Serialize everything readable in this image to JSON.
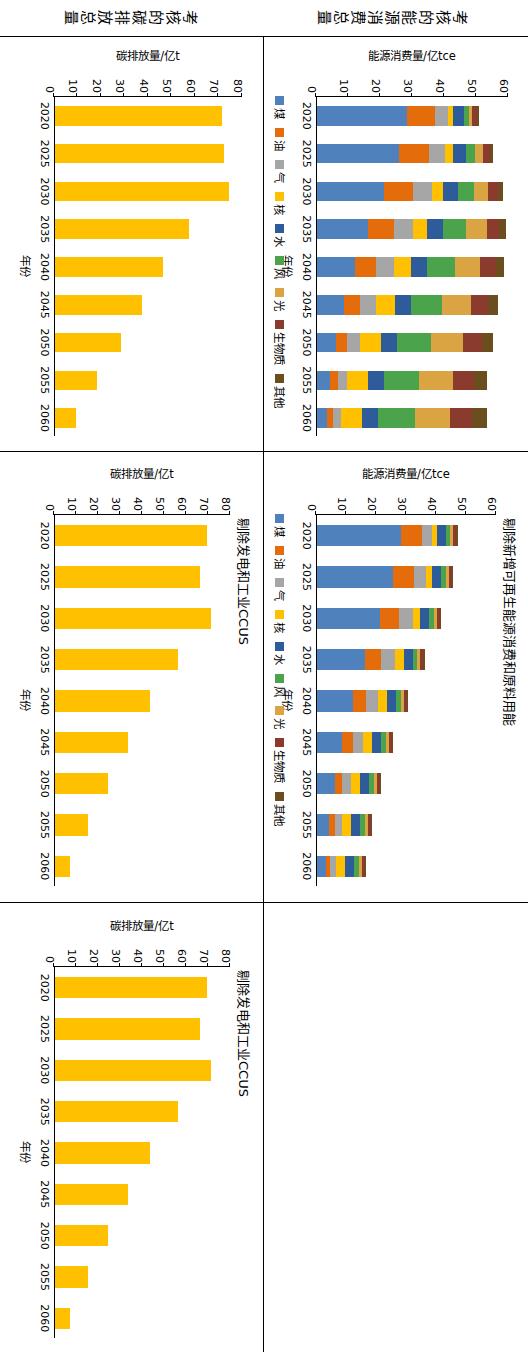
{
  "figure": {
    "row_labels": [
      {
        "id": "row-energy",
        "text": "考核的能源消费总量"
      },
      {
        "id": "row-carbon",
        "text": "考核的碳排放总量"
      }
    ]
  },
  "legend": {
    "labels": [
      "煤",
      "油",
      "气",
      "核",
      "水",
      "风",
      "光",
      "生物质",
      "其他"
    ],
    "colors": [
      "#4F81BD",
      "#E46C0A",
      "#A6A6A6",
      "#FFC000",
      "#2E5C9A",
      "#4BA44B",
      "#D9A441",
      "#8B3A2E",
      "#6A4E1E"
    ]
  },
  "chart_data": [
    {
      "id": "chart-energy-total",
      "type": "bar",
      "stacked": true,
      "title": "",
      "xlabel": "年份",
      "ylabel": "能源消费量/亿tce",
      "categories": [
        "2020",
        "2025",
        "2030",
        "2035",
        "2040",
        "2045",
        "2050",
        "2055",
        "2060"
      ],
      "ylim": [
        0,
        60
      ],
      "yticks": [
        0,
        10,
        20,
        30,
        40,
        50,
        60
      ],
      "series": [
        {
          "name": "煤",
          "color": "#4F81BD",
          "values": [
            28.0,
            25.5,
            21.0,
            16.0,
            12.0,
            8.5,
            6.0,
            4.0,
            3.0
          ]
        },
        {
          "name": "油",
          "color": "#E46C0A",
          "values": [
            9.0,
            9.5,
            9.0,
            8.0,
            6.5,
            5.0,
            3.5,
            2.5,
            2.0
          ]
        },
        {
          "name": "气",
          "color": "#A6A6A6",
          "values": [
            4.0,
            5.0,
            6.0,
            6.0,
            5.5,
            5.0,
            4.0,
            3.0,
            2.5
          ]
        },
        {
          "name": "核",
          "color": "#FFC000",
          "values": [
            1.5,
            2.5,
            3.5,
            4.5,
            5.5,
            6.0,
            6.5,
            6.5,
            6.5
          ]
        },
        {
          "name": "水",
          "color": "#2E5C9A",
          "values": [
            3.5,
            4.0,
            4.5,
            5.0,
            5.0,
            5.0,
            5.0,
            5.0,
            5.0
          ]
        },
        {
          "name": "风",
          "color": "#4BA44B",
          "values": [
            1.5,
            3.0,
            5.0,
            7.0,
            8.5,
            9.5,
            10.5,
            11.0,
            11.5
          ]
        },
        {
          "name": "光",
          "color": "#D9A441",
          "values": [
            1.0,
            2.5,
            4.5,
            6.5,
            8.0,
            9.0,
            10.0,
            10.5,
            11.0
          ]
        },
        {
          "name": "生物质",
          "color": "#8B3A2E",
          "values": [
            1.5,
            2.0,
            3.0,
            4.0,
            5.0,
            5.5,
            6.0,
            6.5,
            7.0
          ]
        },
        {
          "name": "其他",
          "color": "#6A4E1E",
          "values": [
            0.5,
            1.0,
            1.5,
            2.0,
            2.5,
            3.0,
            3.5,
            4.0,
            4.5
          ]
        }
      ]
    },
    {
      "id": "chart-energy-excl-renewable",
      "type": "bar",
      "stacked": true,
      "title": "剔除新增可再生能源消费和原料用能",
      "xlabel": "年份",
      "ylabel": "能源消费量/亿tce",
      "categories": [
        "2020",
        "2025",
        "2030",
        "2035",
        "2040",
        "2045",
        "2050",
        "2055",
        "2060"
      ],
      "ylim": [
        0,
        60
      ],
      "yticks": [
        0,
        10,
        20,
        30,
        40,
        50,
        60
      ],
      "series": [
        {
          "name": "煤",
          "color": "#4F81BD",
          "values": [
            28.0,
            25.5,
            21.0,
            16.0,
            12.0,
            8.5,
            6.0,
            4.0,
            3.0
          ]
        },
        {
          "name": "油",
          "color": "#E46C0A",
          "values": [
            7.0,
            7.0,
            6.5,
            5.5,
            4.5,
            3.5,
            2.5,
            2.0,
            1.5
          ]
        },
        {
          "name": "气",
          "color": "#A6A6A6",
          "values": [
            3.5,
            4.0,
            4.5,
            4.5,
            4.0,
            3.5,
            3.0,
            2.5,
            2.0
          ]
        },
        {
          "name": "核",
          "color": "#FFC000",
          "values": [
            1.5,
            2.0,
            2.5,
            3.0,
            3.0,
            3.0,
            3.0,
            3.0,
            3.0
          ]
        },
        {
          "name": "水",
          "color": "#2E5C9A",
          "values": [
            3.0,
            3.0,
            3.0,
            3.0,
            3.0,
            3.0,
            3.0,
            3.0,
            3.0
          ]
        },
        {
          "name": "风",
          "color": "#4BA44B",
          "values": [
            1.5,
            1.5,
            1.5,
            1.5,
            1.5,
            1.5,
            1.5,
            1.5,
            1.5
          ]
        },
        {
          "name": "光",
          "color": "#D9A441",
          "values": [
            1.0,
            1.0,
            1.0,
            1.0,
            1.0,
            1.0,
            1.0,
            1.0,
            1.0
          ]
        },
        {
          "name": "生物质",
          "color": "#8B3A2E",
          "values": [
            1.0,
            1.0,
            1.0,
            1.0,
            1.0,
            1.0,
            1.0,
            1.0,
            1.0
          ]
        },
        {
          "name": "其他",
          "color": "#6A4E1E",
          "values": [
            0.5,
            0.5,
            0.5,
            0.5,
            0.5,
            0.5,
            0.5,
            0.5,
            0.5
          ]
        }
      ]
    },
    {
      "id": "chart-carbon-total",
      "type": "bar",
      "stacked": false,
      "title": "",
      "xlabel": "年份",
      "ylabel": "碳排放量/亿t",
      "categories": [
        "2020",
        "2025",
        "2030",
        "2035",
        "2040",
        "2045",
        "2050",
        "2055",
        "2060"
      ],
      "ylim": [
        0,
        80
      ],
      "yticks": [
        0,
        10,
        20,
        30,
        40,
        50,
        60,
        70,
        80
      ],
      "series": [
        {
          "name": "碳排放量",
          "color": "#FFC000",
          "values": [
            71,
            72,
            74,
            57,
            46,
            37,
            28,
            18,
            9
          ]
        }
      ]
    },
    {
      "id": "chart-carbon-excl-ccus",
      "type": "bar",
      "stacked": false,
      "title": "剔除发电和工业CCUS",
      "xlabel": "年份",
      "ylabel": "碳排放量/亿t",
      "categories": [
        "2020",
        "2025",
        "2030",
        "2035",
        "2040",
        "2045",
        "2050",
        "2055",
        "2060"
      ],
      "ylim": [
        0,
        80
      ],
      "yticks": [
        0,
        10,
        20,
        30,
        40,
        50,
        60,
        70,
        80
      ],
      "series": [
        {
          "name": "碳排放量",
          "color": "#FFC000",
          "values": [
            69,
            66,
            71,
            56,
            43,
            33,
            24,
            15,
            7
          ]
        }
      ]
    }
  ]
}
